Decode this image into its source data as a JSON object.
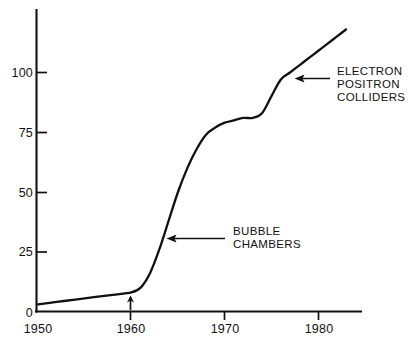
{
  "chart_data": {
    "type": "line",
    "title": "",
    "subtitle": "",
    "xlabel": "",
    "ylabel": "",
    "xlim": [
      1950,
      1983.5
    ],
    "ylim": [
      0,
      122
    ],
    "grid": false,
    "legend_position": "none",
    "x_ticks": [
      1950,
      1960,
      1970,
      1980
    ],
    "x_tick_labels": [
      "1950",
      "1960",
      "1970",
      "1980"
    ],
    "y_ticks": [
      0,
      25,
      50,
      75,
      100
    ],
    "y_tick_labels": [
      "0",
      "25",
      "50",
      "75",
      "100"
    ],
    "series": [
      {
        "name": "cumulative-discoveries",
        "x": [
          1950,
          1952,
          1954,
          1956,
          1958,
          1960,
          1961,
          1962,
          1963,
          1964,
          1965,
          1966,
          1967,
          1968,
          1969,
          1970,
          1971,
          1972,
          1973,
          1974,
          1975,
          1976,
          1977,
          1978,
          1979,
          1980,
          1981,
          1982,
          1983
        ],
        "values": [
          3,
          4,
          5,
          6,
          7,
          8,
          10,
          16,
          26,
          38,
          50,
          60,
          68,
          74,
          77,
          79,
          80,
          81,
          81,
          83,
          90,
          97,
          100,
          103,
          106,
          109,
          112,
          115,
          118
        ]
      }
    ],
    "annotations": [
      {
        "name": "bubble-chambers",
        "lines": [
          "BUBBLE",
          "CHAMBERS"
        ],
        "arrow": "left-arrow",
        "points_to_x": 1964.5,
        "points_to_y": 40
      },
      {
        "name": "electron-positron-colliders",
        "lines": [
          "ELECTRON",
          "POSITRON",
          "COLLIDERS"
        ],
        "arrow": "left-arrow",
        "points_to_x": 1976.0,
        "points_to_y": 97
      }
    ],
    "markers": [
      {
        "name": "year-1960-up-arrow",
        "glyph": "up-arrow",
        "x": 1960,
        "y": 0
      }
    ],
    "colors": {
      "ink": "#111111",
      "background": "#ffffff"
    }
  }
}
